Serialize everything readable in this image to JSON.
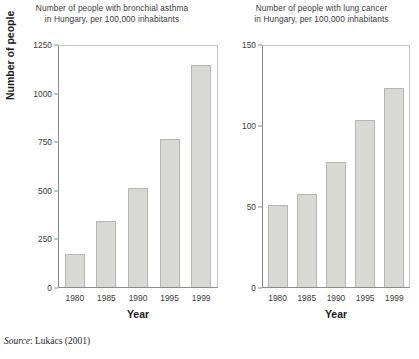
{
  "figure": {
    "source_prefix": "Source",
    "source_text": ": Lukács (2001)"
  },
  "panels": [
    {
      "key": "asthma",
      "title_line1": "Number of people with bronchial asthma",
      "title_line2": "in Hungary, per 100,000 inhabitants",
      "ylabel": "Number of people",
      "xlabel": "Year"
    },
    {
      "key": "lung_cancer",
      "title_line1": "Number of people with lung cancer",
      "title_line2": "in Hungary, per 100,000 inhabitants",
      "ylabel": "",
      "xlabel": "Year"
    }
  ],
  "chart_data": [
    {
      "type": "bar",
      "title": "Number of people with bronchial asthma in Hungary, per 100,000 inhabitants",
      "xlabel": "Year",
      "ylabel": "Number of people",
      "categories": [
        "1980",
        "1985",
        "1990",
        "1995",
        "1999"
      ],
      "values": [
        170,
        340,
        515,
        770,
        1150
      ],
      "ylim": [
        0,
        1250
      ],
      "yticks": [
        0,
        250,
        500,
        750,
        1000,
        1250
      ],
      "ytick_labels": [
        "0",
        "250",
        "500",
        "750",
        "1000",
        "1250"
      ],
      "grid": false,
      "legend": "none",
      "bar_fill": "#d8d8d4",
      "bar_edge": "#b6b6b2"
    },
    {
      "type": "bar",
      "title": "Number of people with lung cancer in Hungary, per 100,000 inhabitants",
      "xlabel": "Year",
      "ylabel": "",
      "categories": [
        "1980",
        "1985",
        "1990",
        "1995",
        "1999"
      ],
      "values": [
        51,
        58,
        78,
        104,
        124
      ],
      "ylim": [
        0,
        150
      ],
      "yticks": [
        0,
        50,
        100,
        150
      ],
      "ytick_labels": [
        "0",
        "50",
        "100",
        "150"
      ],
      "grid": false,
      "legend": "none",
      "bar_fill": "#d8d8d4",
      "bar_edge": "#b6b6b2"
    }
  ]
}
